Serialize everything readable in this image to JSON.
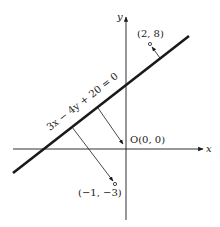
{
  "diagram": {
    "line_equation": "3x − 4y + 20 = 0",
    "origin_label": "O(0, 0)",
    "point_a_label": "(2, 8)",
    "point_b_label": "(−1, −3)",
    "x_axis_label": "x",
    "y_axis_label": "y",
    "colors": {
      "ink": "#1a1a1a",
      "background": "#ffffff"
    }
  }
}
